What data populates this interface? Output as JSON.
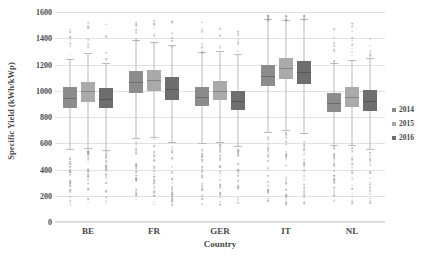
{
  "chart_data": {
    "type": "bar",
    "chart_subtype": "grouped-boxplot",
    "title": "",
    "xlabel": "Country",
    "ylabel": "Specific Yield (kWh/kWp)",
    "categories": [
      "BE",
      "FR",
      "GER",
      "IT",
      "NL"
    ],
    "ylim": [
      0,
      1600
    ],
    "yticks": [
      0,
      200,
      400,
      600,
      800,
      1000,
      1200,
      1400,
      1600
    ],
    "ytick_labels": [
      "0",
      "200",
      "400",
      "600",
      "800",
      "1000",
      "1200",
      "1400",
      "1600"
    ],
    "grid": true,
    "legend_position": "right",
    "legend_entries": [
      "2014",
      "2015",
      "2016"
    ],
    "colors": {
      "2014": "#8c8c8c",
      "2015": "#aaaaaa",
      "2016": "#6e6e6e",
      "gridline": "#e2e2e2",
      "whisker": "#b9b9b9",
      "outlier": "#a8a8a8",
      "text": "#4a4a4a"
    },
    "series": [
      {
        "name": "2014",
        "boxes": [
          {
            "category": "BE",
            "whisker_low": 560,
            "q1": 870,
            "median": 945,
            "q3": 1025,
            "whisker_high": 1245
          },
          {
            "category": "FR",
            "whisker_low": 640,
            "q1": 980,
            "median": 1065,
            "q3": 1150,
            "whisker_high": 1390
          },
          {
            "category": "GER",
            "whisker_low": 600,
            "q1": 885,
            "median": 950,
            "q3": 1025,
            "whisker_high": 1295
          },
          {
            "category": "IT",
            "whisker_low": 685,
            "q1": 1040,
            "median": 1115,
            "q3": 1200,
            "whisker_high": 1545
          },
          {
            "category": "NL",
            "whisker_low": 585,
            "q1": 840,
            "median": 910,
            "q3": 985,
            "whisker_high": 1215
          }
        ]
      },
      {
        "name": "2015",
        "boxes": [
          {
            "category": "BE",
            "whisker_low": 565,
            "q1": 915,
            "median": 995,
            "q3": 1070,
            "whisker_high": 1290
          },
          {
            "category": "FR",
            "whisker_low": 650,
            "q1": 1000,
            "median": 1080,
            "q3": 1160,
            "whisker_high": 1370
          },
          {
            "category": "GER",
            "whisker_low": 610,
            "q1": 930,
            "median": 1000,
            "q3": 1075,
            "whisker_high": 1300
          },
          {
            "category": "IT",
            "whisker_low": 700,
            "q1": 1090,
            "median": 1170,
            "q3": 1250,
            "whisker_high": 1540
          },
          {
            "category": "NL",
            "whisker_low": 590,
            "q1": 880,
            "median": 950,
            "q3": 1025,
            "whisker_high": 1235
          }
        ]
      },
      {
        "name": "2016",
        "boxes": [
          {
            "category": "BE",
            "whisker_low": 550,
            "q1": 865,
            "median": 935,
            "q3": 1020,
            "whisker_high": 1215
          },
          {
            "category": "FR",
            "whisker_low": 610,
            "q1": 930,
            "median": 1015,
            "q3": 1105,
            "whisker_high": 1345
          },
          {
            "category": "GER",
            "whisker_low": 580,
            "q1": 850,
            "median": 925,
            "q3": 1000,
            "whisker_high": 1280
          },
          {
            "category": "IT",
            "whisker_low": 680,
            "q1": 1055,
            "median": 1140,
            "q3": 1230,
            "whisker_high": 1550
          },
          {
            "category": "NL",
            "whisker_low": 560,
            "q1": 845,
            "median": 925,
            "q3": 1005,
            "whisker_high": 1250
          }
        ]
      }
    ]
  },
  "axes": {
    "y_title": "Specific Yield (kWh/kWp)",
    "x_title": "Country"
  },
  "legend": {
    "items": [
      {
        "label": "2014",
        "color": "#8c8c8c"
      },
      {
        "label": "2015",
        "color": "#aaaaaa"
      },
      {
        "label": "2016",
        "color": "#6e6e6e"
      }
    ]
  }
}
